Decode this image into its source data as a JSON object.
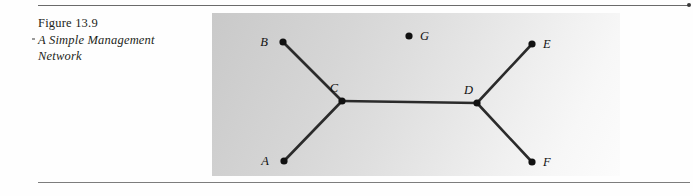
{
  "figure": {
    "caption_lines": [
      "Figure 13.9",
      "A Simple Management",
      "Network"
    ],
    "caption_number": "Figure 13.9",
    "caption_title_line1": "A Simple Management",
    "caption_title_line2": "Network"
  },
  "diagram": {
    "title": "A Simple Management Network",
    "type": "node-link-graph",
    "panel": {
      "x": 212,
      "y": 13,
      "width": 408,
      "height": 163
    },
    "node_color": "#111111",
    "edge_color": "#2b2b2b",
    "nodes": [
      {
        "id": "A",
        "label": "A",
        "x": 72,
        "y": 148,
        "label_x": 57,
        "label_y": 152,
        "label_anchor": "end"
      },
      {
        "id": "B",
        "label": "B",
        "x": 71,
        "y": 29,
        "label_x": 56,
        "label_y": 33,
        "label_anchor": "end"
      },
      {
        "id": "C",
        "label": "C",
        "x": 130,
        "y": 88,
        "label_x": 126,
        "label_y": 79,
        "label_anchor": "end"
      },
      {
        "id": "D",
        "label": "D",
        "x": 265,
        "y": 90,
        "label_x": 261,
        "label_y": 81,
        "label_anchor": "end"
      },
      {
        "id": "E",
        "label": "E",
        "x": 320,
        "y": 31,
        "label_x": 331,
        "label_y": 35,
        "label_anchor": "start"
      },
      {
        "id": "F",
        "label": "F",
        "x": 320,
        "y": 149,
        "label_x": 331,
        "label_y": 153,
        "label_anchor": "start"
      },
      {
        "id": "G",
        "label": "G",
        "x": 197,
        "y": 23,
        "label_x": 208,
        "label_y": 27,
        "label_anchor": "start"
      }
    ],
    "edges": [
      {
        "from": "B",
        "to": "C"
      },
      {
        "from": "A",
        "to": "C"
      },
      {
        "from": "C",
        "to": "D"
      },
      {
        "from": "D",
        "to": "E"
      },
      {
        "from": "D",
        "to": "F"
      }
    ],
    "isolated_nodes": [
      "G"
    ]
  }
}
